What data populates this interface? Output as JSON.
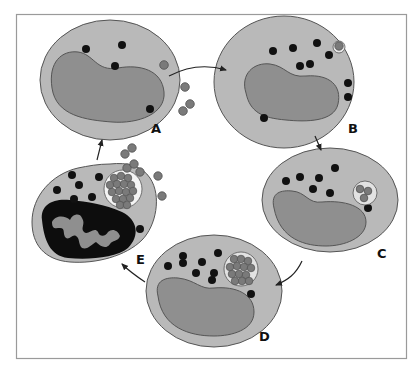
{
  "figure": {
    "frame": {
      "x": 16,
      "y": 14,
      "w": 390,
      "h": 344,
      "stroke": "#9a9a9a"
    },
    "colors": {
      "cytoplasm": "#b9b9b9",
      "nucleus": "#8f8f8f",
      "outline": "#555555",
      "granule": "#111111",
      "bacterium": "#7a7a7a",
      "bacterium_outline": "#505050",
      "vacuole": "#e2e2e2",
      "pyknotic_nucleus": "#0d0d0d",
      "arrow": "#222222"
    },
    "stages": [
      {
        "id": "A",
        "label": "A",
        "label_x": 156,
        "label_y": 133
      },
      {
        "id": "B",
        "label": "B",
        "label_x": 350,
        "label_y": 133
      },
      {
        "id": "C",
        "label": "C",
        "label_x": 378,
        "label_y": 258
      },
      {
        "id": "D",
        "label": "D",
        "label_x": 262,
        "label_y": 341
      },
      {
        "id": "E",
        "label": "E",
        "label_x": 138,
        "label_y": 264
      }
    ],
    "cycle_order": [
      "A",
      "B",
      "C",
      "D",
      "E",
      "A"
    ]
  }
}
